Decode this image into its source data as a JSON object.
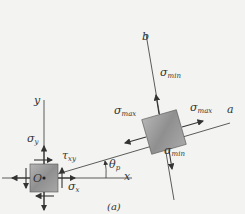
{
  "figure": {
    "caption": "(a)",
    "axes": {
      "x_label": "x",
      "y_label": "y",
      "a_label": "a",
      "b_label": "b",
      "origin_label": "O"
    },
    "angle_label": "θ",
    "angle_subscript": "p",
    "left_element": {
      "sigma_y": "σ",
      "sigma_y_sub": "y",
      "sigma_x": "σ",
      "sigma_x_sub": "x",
      "tau_xy": "τ",
      "tau_xy_sub": "xy"
    },
    "rotated_element": {
      "sigma_max_left": "σ",
      "sigma_max_left_sub": "max",
      "sigma_max_right": "σ",
      "sigma_max_right_sub": "max",
      "sigma_min_top": "σ",
      "sigma_min_top_sub": "min",
      "sigma_min_bottom": "σ",
      "sigma_min_bottom_sub": "min"
    },
    "colors": {
      "background": "#f3f3f1",
      "line": "#333333",
      "element_fill": "#9a9a9a"
    }
  }
}
